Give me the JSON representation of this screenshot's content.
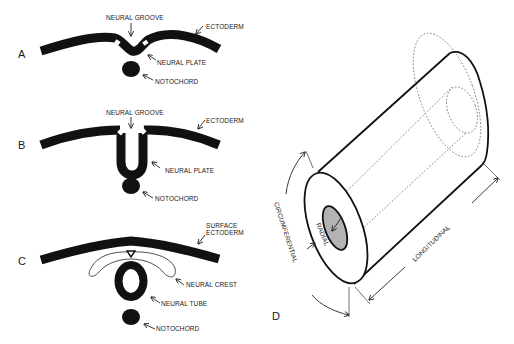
{
  "figure": {
    "panels": {
      "A": {
        "letter": "A",
        "labels": {
          "neural_groove": "NEURAL GROOVE",
          "ectoderm": "ECTODERM",
          "neural_plate": "NEURAL PLATE",
          "notochord": "NOTOCHORD"
        }
      },
      "B": {
        "letter": "B",
        "labels": {
          "neural_groove": "NEURAL GROOVE",
          "ectoderm": "ECTODERM",
          "neural_plate": "NEURAL PLATE",
          "notochord": "NOTOCHORD"
        }
      },
      "C": {
        "letter": "C",
        "labels": {
          "surface_ectoderm_line1": "SURFACE",
          "surface_ectoderm_line2": "ECTODERM",
          "neural_crest": "NEURAL CREST",
          "neural_tube": "NEURAL TUBE",
          "notochord": "NOTOCHORD"
        }
      },
      "D": {
        "letter": "D",
        "labels": {
          "circumferential": "CIRCUMFERENTIAL",
          "radial": "RADIAL",
          "longitudinal": "LONGITUDINAL"
        }
      }
    },
    "colors": {
      "tissue": "#111111",
      "lumen_fill": "#b3b3b3",
      "background": "#ffffff"
    }
  }
}
